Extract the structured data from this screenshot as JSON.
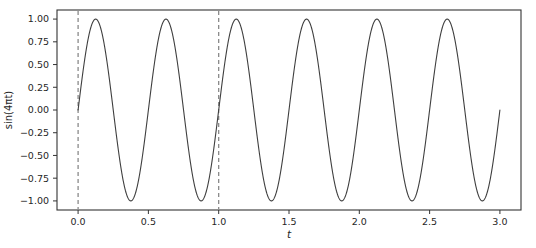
{
  "chart_data": {
    "type": "line",
    "title": "",
    "xlabel": "t",
    "ylabel": "sin(4πt)",
    "xlim": [
      -0.15,
      3.15
    ],
    "ylim": [
      -1.1,
      1.1
    ],
    "xticks": [
      0.0,
      0.5,
      1.0,
      1.5,
      2.0,
      2.5,
      3.0
    ],
    "xticklabels": [
      "0.0",
      "0.5",
      "1.0",
      "1.5",
      "2.0",
      "2.5",
      "3.0"
    ],
    "yticks": [
      -1.0,
      -0.75,
      -0.5,
      -0.25,
      0.0,
      0.25,
      0.5,
      0.75,
      1.0
    ],
    "yticklabels": [
      "−1.00",
      "−0.75",
      "−0.50",
      "−0.25",
      "0.00",
      "0.25",
      "0.50",
      "0.75",
      "1.00"
    ],
    "grid": false,
    "legend": null,
    "series": [
      {
        "name": "sin(4πt)",
        "color": "#3f3f3f",
        "linewidth": 1.1,
        "linestyle": "solid",
        "function": "sin(4*pi*t)",
        "x_start": 0.0,
        "x_end": 3.0,
        "amplitude": 1.0,
        "period": 0.5,
        "num_periods": 6,
        "peaks_x": [
          0.125,
          0.625,
          1.125,
          1.625,
          2.125,
          2.625
        ],
        "peaks_y": [
          1.0,
          1.0,
          1.0,
          1.0,
          1.0,
          1.0
        ],
        "troughs_x": [
          0.375,
          0.875,
          1.375,
          1.875,
          2.375,
          2.875
        ],
        "troughs_y": [
          -1.0,
          -1.0,
          -1.0,
          -1.0,
          -1.0,
          -1.0
        ],
        "zero_crossings_x": [
          0.0,
          0.25,
          0.5,
          0.75,
          1.0,
          1.25,
          1.5,
          1.75,
          2.0,
          2.25,
          2.5,
          2.75,
          3.0
        ]
      }
    ],
    "vlines": [
      {
        "name": "marker-line-start",
        "x": 0.0,
        "color": "#808080",
        "linestyle": "dashed",
        "linewidth": 1.2
      },
      {
        "name": "marker-line-end",
        "x": 1.0,
        "color": "#808080",
        "linestyle": "dashed",
        "linewidth": 1.2
      }
    ],
    "frame": {
      "color": "#333333",
      "visible": true
    },
    "background": "#ffffff"
  }
}
